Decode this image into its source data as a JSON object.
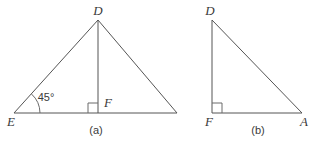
{
  "figure": {
    "background_color": "#ffffff",
    "stroke_color": "#555555",
    "text_color": "#3a3a3a",
    "width": 322,
    "height": 145
  },
  "figure_a": {
    "caption": "(a)",
    "angle_label": "45°",
    "vertices": {
      "apex": "D",
      "left_base": "E",
      "foot": "F"
    },
    "description": "Triangle with apex D, base from E to an unlabeled right vertex, altitude DF perpendicular to the base at F, and a 45 degree angle at E."
  },
  "figure_b": {
    "caption": "(b)",
    "vertices": {
      "top": "D",
      "right_angle": "F",
      "right_base": "A"
    },
    "description": "Right triangle with the right angle at F, vertical leg FD, horizontal leg FA, and hypotenuse DA."
  }
}
